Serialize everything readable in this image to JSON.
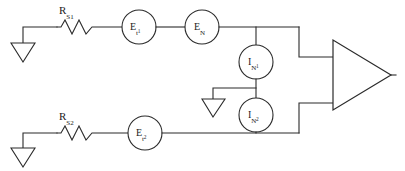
{
  "diagram": {
    "type": "schematic",
    "stroke_color": "#2b2b2b",
    "background_color": "#ffffff",
    "components": {
      "resistor_top": {
        "name": "R_S1",
        "label_base": "R",
        "label_sub": "S1",
        "kind": "resistor"
      },
      "resistor_bottom": {
        "name": "R_S2",
        "label_base": "R",
        "label_sub": "S2",
        "kind": "resistor"
      },
      "source_et1": {
        "name": "E_t1",
        "label_base": "E",
        "label_sub": "t",
        "label_subsub": "1",
        "kind": "voltage-source"
      },
      "source_en": {
        "name": "E_N",
        "label_base": "E",
        "label_sub": "N",
        "label_subsub": "",
        "kind": "voltage-source"
      },
      "source_et2": {
        "name": "E_t2",
        "label_base": "E",
        "label_sub": "t",
        "label_subsub": "2",
        "kind": "voltage-source"
      },
      "source_in1": {
        "name": "I_N1",
        "label_base": "I",
        "label_sub": "N",
        "label_subsub": "1",
        "kind": "current-source"
      },
      "source_in2": {
        "name": "I_N2",
        "label_base": "I",
        "label_sub": "N",
        "label_subsub": "2",
        "kind": "current-source"
      },
      "amplifier": {
        "name": "amplifier",
        "kind": "triangle-amplifier",
        "label": ""
      },
      "grounds": [
        {
          "name": "ground-top-left",
          "kind": "ground"
        },
        {
          "name": "ground-middle",
          "kind": "ground"
        },
        {
          "name": "ground-bottom-left",
          "kind": "ground"
        }
      ]
    }
  }
}
